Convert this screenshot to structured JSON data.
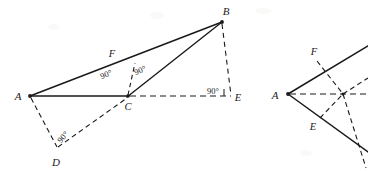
{
  "figure": {
    "background_color": "#ffffff",
    "ink_color": "#1a1a1a",
    "type": "geometry-diagram-pair",
    "caption": ""
  },
  "diagram_left": {
    "name": "left-geometry-figure",
    "points": {
      "A": {
        "label": "A",
        "x": 30,
        "y": 96,
        "label_x": 18,
        "label_y": 100
      },
      "B": {
        "label": "B",
        "x": 222,
        "y": 22,
        "label_x": 226,
        "label_y": 14
      },
      "C": {
        "label": "C",
        "x": 128,
        "y": 96,
        "label_x": 127,
        "label_y": 110
      },
      "D": {
        "label": "D",
        "x": 57,
        "y": 148,
        "label_x": 54,
        "label_y": 165
      },
      "E": {
        "label": "E",
        "x": 232,
        "y": 96,
        "label_x": 236,
        "label_y": 101
      },
      "F": {
        "label": "F",
        "x": 135,
        "y": 62,
        "label_x": 111,
        "label_y": 56
      }
    },
    "angles": [
      {
        "id": "angle-AFC",
        "text": "90°",
        "x": 107,
        "y": 76,
        "rotate": -21
      },
      {
        "id": "angle-BFC",
        "text": "90°",
        "x": 138,
        "y": 74,
        "rotate": -21
      },
      {
        "id": "angle-D",
        "text": "90°",
        "x": 62,
        "y": 139,
        "rotate": -48
      },
      {
        "id": "angle-E",
        "text": "90°",
        "x": 205,
        "y": 93,
        "rotate": 0
      }
    ],
    "segments": [
      {
        "id": "segment-AB",
        "from": "A",
        "to": "B",
        "style": "solid"
      },
      {
        "id": "segment-AC",
        "from": "A",
        "to": "C",
        "style": "solid"
      },
      {
        "id": "segment-BC",
        "from": "B",
        "to": "C",
        "style": "solid"
      },
      {
        "id": "segment-CE",
        "from": "C",
        "to": "E",
        "style": "dashed"
      },
      {
        "id": "segment-BE",
        "from": "B",
        "to": "E",
        "style": "dashed"
      },
      {
        "id": "segment-CF",
        "from": "C",
        "to": "F",
        "style": "dashed"
      },
      {
        "id": "segment-AD",
        "from": "A",
        "to": "D",
        "style": "dashed"
      },
      {
        "id": "segment-DC",
        "from": "D",
        "to": "C",
        "style": "dashed"
      }
    ]
  },
  "diagram_right": {
    "name": "right-geometry-figure",
    "points": {
      "A": {
        "label": "A",
        "x": 288,
        "y": 94,
        "label_x": 272,
        "label_y": 99
      },
      "F": {
        "label": "F",
        "x": 318,
        "y": 60,
        "label_x": 313,
        "label_y": 54
      },
      "E": {
        "label": "E",
        "x": 321,
        "y": 117,
        "label_x": 313,
        "label_y": 128
      },
      "X": {
        "label": "",
        "x": 343,
        "y": 94,
        "label_x": 0,
        "label_y": 0
      }
    },
    "angles": [],
    "segments": [
      {
        "id": "segment-A-up-right",
        "from": "A",
        "to": "topright",
        "style": "solid"
      },
      {
        "id": "segment-A-down-right",
        "from": "A",
        "to": "bottomright",
        "style": "solid"
      },
      {
        "id": "segment-AX-horizontal",
        "from": "A",
        "to": "X",
        "style": "dashed"
      },
      {
        "id": "segment-FX",
        "from": "F",
        "to": "X",
        "style": "dashed"
      },
      {
        "id": "segment-EX",
        "from": "E",
        "to": "X",
        "style": "dashed"
      },
      {
        "id": "segment-X-out",
        "from": "X",
        "to": "right",
        "style": "dashed"
      }
    ]
  }
}
